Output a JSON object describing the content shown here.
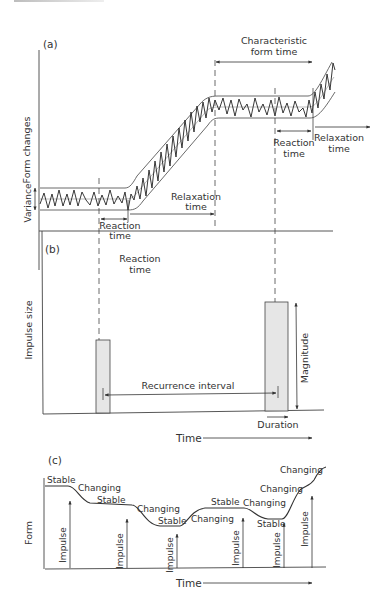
{
  "panel_a": {
    "label": "(a)",
    "y_axis_label": "Form changes",
    "variance_label": "Variance",
    "characteristic_form_time": [
      "Characteristic",
      "form time"
    ],
    "reaction_time_left": [
      "Reaction",
      "time"
    ],
    "relaxation_time_mid": [
      "Relaxation",
      "time"
    ],
    "reaction_time_right": [
      "Reaction",
      "time"
    ],
    "relaxation_time_right": [
      "Relaxation",
      "time"
    ]
  },
  "panel_b": {
    "label": "(b)",
    "y_axis_label": "Impulse size",
    "reaction_time": [
      "Reaction",
      "time"
    ],
    "recurrence_interval": "Recurrence interval",
    "magnitude": "Magnitude",
    "duration": "Duration",
    "x_axis_label": "Time"
  },
  "panel_c": {
    "label": "(c)",
    "y_axis_label": "Form",
    "x_axis_label": "Time",
    "states": [
      "Stable",
      "Changing",
      "Stable",
      "Changing",
      "Stable",
      "Changing",
      "Stable",
      "Changing",
      "Stable",
      "Changing",
      "Changing"
    ],
    "impulse_label": "Impulse",
    "impulse_count": 6
  },
  "colors": {
    "line": "#333333",
    "bar_fill": "#e6e6e6"
  }
}
